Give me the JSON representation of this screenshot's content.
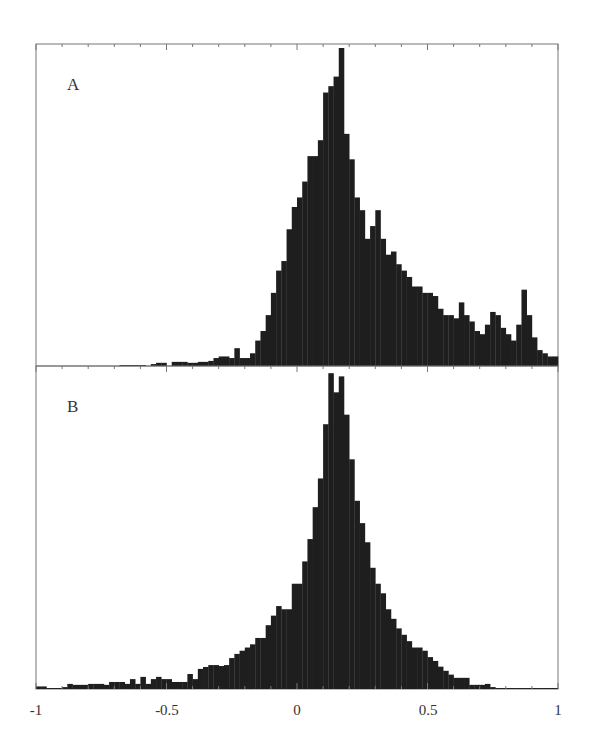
{
  "figure": {
    "background": "#ffffff",
    "bar_color": "#1e1e1e",
    "axis_color": "#777777"
  },
  "chart_data": [
    {
      "type": "bar",
      "panel": "A",
      "title": "A",
      "xlabel": "",
      "ylabel": "",
      "xlim": [
        -1,
        1
      ],
      "bin_width": 0.02,
      "grid": false,
      "legend": false,
      "x_start": -1,
      "ylim": [
        0,
        100
      ],
      "values": [
        0,
        0,
        0,
        0,
        0,
        0,
        0,
        0,
        0,
        0,
        0,
        0,
        0,
        0,
        0,
        0,
        0.3,
        0.3,
        0.3,
        0.3,
        0.3,
        0,
        0.6,
        1,
        1,
        0,
        1.3,
        1.3,
        1.3,
        1,
        1,
        1.3,
        1.3,
        1.6,
        2.5,
        3,
        3,
        2.5,
        5.6,
        2.5,
        2.5,
        4,
        8,
        11,
        16,
        23,
        30,
        33,
        43,
        50,
        53,
        58,
        66,
        66,
        71,
        86,
        88,
        91,
        100,
        73,
        65,
        53,
        49,
        40,
        44,
        49,
        40,
        35,
        36,
        32,
        30,
        28,
        25,
        25,
        23,
        23,
        22,
        18,
        16,
        16,
        15,
        20,
        16,
        14,
        11,
        10,
        13,
        17,
        16,
        12,
        10,
        8,
        13,
        24,
        16,
        9,
        5,
        4,
        3,
        3
      ]
    },
    {
      "type": "bar",
      "panel": "B",
      "title": "B",
      "xlabel": "",
      "ylabel": "",
      "xlim": [
        -1,
        1
      ],
      "bin_width": 0.02,
      "grid": false,
      "legend": false,
      "x_start": -1,
      "ylim": [
        0,
        100
      ],
      "values": [
        0.8,
        0.8,
        0.3,
        0.3,
        0.3,
        0.6,
        1.6,
        1.3,
        1.3,
        1.3,
        1.6,
        1.6,
        1.6,
        1.3,
        2.2,
        2.2,
        2.2,
        1.6,
        3.1,
        1.6,
        3.8,
        1.6,
        3.1,
        3.8,
        3.1,
        3.1,
        2.2,
        2.2,
        2.2,
        4.7,
        3.1,
        6.3,
        6.9,
        7.5,
        7.5,
        7.2,
        7.5,
        9.7,
        11,
        12,
        13,
        14,
        16,
        16,
        20,
        23,
        26,
        25,
        25,
        33,
        33,
        40,
        47,
        57,
        66,
        83,
        99,
        93,
        98,
        86,
        72,
        59,
        52,
        46,
        38,
        33,
        30,
        25,
        22,
        19,
        17,
        15,
        13,
        13,
        12,
        10,
        8.8,
        7,
        5.7,
        4.5,
        3.5,
        3.5,
        3.5,
        1.3,
        1.3,
        1.3,
        1.6,
        0.6,
        0.3,
        0.3,
        0.3,
        0.3,
        0.3,
        0.3,
        0.3,
        0.3,
        0.3,
        0.3,
        0.3,
        0.3
      ]
    }
  ],
  "x_axis": {
    "ticks": [
      "-1",
      "-0.5",
      "0",
      "0.5",
      "1"
    ],
    "tick_values": [
      -1,
      -0.5,
      0,
      0.5,
      1
    ]
  },
  "panels": [
    {
      "label": "A"
    },
    {
      "label": "B"
    }
  ]
}
